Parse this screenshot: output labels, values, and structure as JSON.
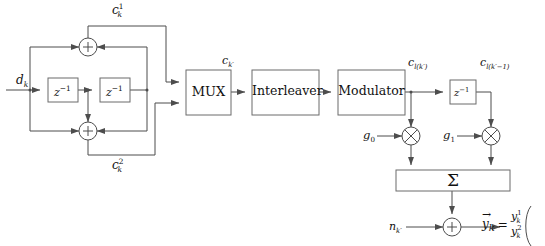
{
  "diagram": {
    "blocks": [
      {
        "name": "mux",
        "label": "MUX",
        "x": 186,
        "y": 70,
        "w": 45,
        "h": 45
      },
      {
        "name": "interleaver",
        "label": "Interleaver",
        "x": 252,
        "y": 70,
        "w": 67,
        "h": 45
      },
      {
        "name": "modulator",
        "label": "Modulator",
        "x": 338,
        "y": 70,
        "w": 67,
        "h": 45
      },
      {
        "name": "summation",
        "label": "Σ",
        "x": 396,
        "y": 170,
        "w": 114,
        "h": 21
      }
    ],
    "delay_blocks": [
      {
        "name": "encoder-delay-1",
        "label": "z",
        "exp": "−1",
        "x": 48,
        "y": 78,
        "w": 30,
        "h": 24
      },
      {
        "name": "encoder-delay-2",
        "label": "z",
        "exp": "−1",
        "x": 100,
        "y": 78,
        "w": 30,
        "h": 24
      },
      {
        "name": "channel-delay",
        "label": "z",
        "exp": "−1",
        "x": 450,
        "y": 80,
        "w": 26,
        "h": 24
      }
    ],
    "adders": [
      {
        "name": "encoder-adder-top",
        "symbol": "+",
        "cx": 88,
        "cy": 47,
        "r": 9
      },
      {
        "name": "encoder-adder-bottom",
        "symbol": "+",
        "cx": 88,
        "cy": 131,
        "r": 9
      },
      {
        "name": "noise-adder",
        "symbol": "+",
        "cx": 452,
        "cy": 227,
        "r": 9
      }
    ],
    "multipliers": [
      {
        "name": "multiplier-g0",
        "symbol": "⊗",
        "cx": 411,
        "cy": 136,
        "r": 9
      },
      {
        "name": "multiplier-g1",
        "symbol": "⊗",
        "cx": 491,
        "cy": 136,
        "r": 9
      }
    ],
    "signal_labels": {
      "input": {
        "base": "d",
        "sub": "k",
        "x": 16,
        "y": 74
      },
      "parity_1": {
        "base": "c",
        "sub": "k",
        "sup": "1",
        "x": 112,
        "y": 3
      },
      "parity_2": {
        "base": "c",
        "sub": "k",
        "sup": "2",
        "x": 112,
        "y": 158
      },
      "mux_output": {
        "base": "c",
        "sub": "k′",
        "x": 222,
        "y": 55
      },
      "modulator_output": {
        "base": "c",
        "sub": "l(k′)",
        "x": 408,
        "y": 57
      },
      "delayed_symbol": {
        "base": "c",
        "sub": "l(k′−1)",
        "x": 480,
        "y": 57
      },
      "gain_0": {
        "base": "g",
        "sub": "0",
        "x": 363,
        "y": 130
      },
      "gain_1": {
        "base": "g",
        "sub": "1",
        "x": 443,
        "y": 130
      },
      "noise": {
        "base": "n",
        "sub": "k′",
        "x": 389,
        "y": 221
      }
    },
    "vector_output": {
      "name": "received-vector",
      "symbol": "y",
      "symbol_sub": "k",
      "equals": "=",
      "components": [
        {
          "base": "y",
          "sub": "k",
          "sup": "1"
        },
        {
          "base": "y",
          "sub": "k",
          "sup": "2"
        }
      ],
      "x": 482,
      "y": 210
    },
    "colors": {
      "line": "#4d4d4d",
      "box_stroke": "#6b6b6b",
      "text": "#111111",
      "background": "#ffffff"
    }
  }
}
